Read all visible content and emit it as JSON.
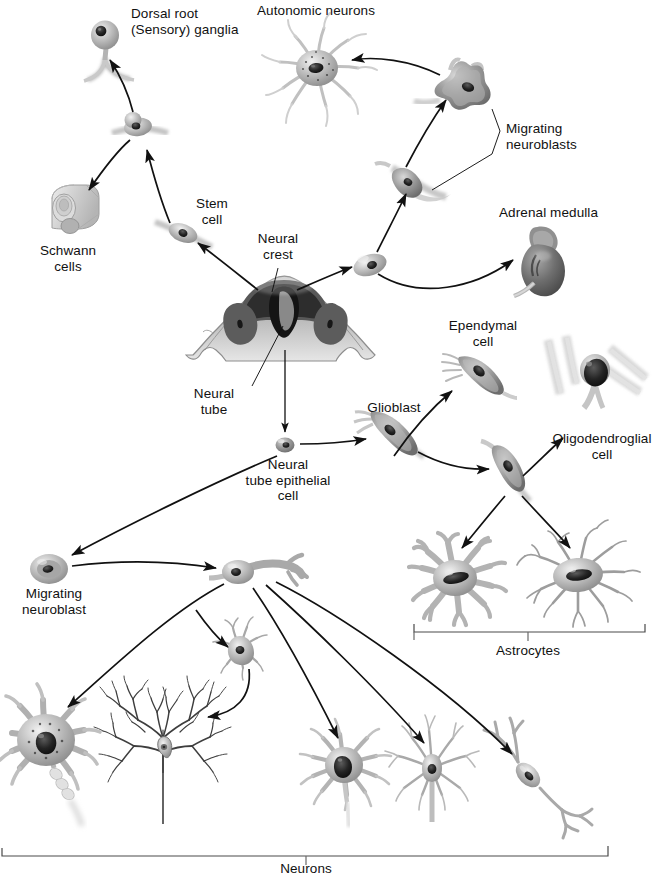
{
  "figure": {
    "background_color": "#ffffff",
    "ink_color": "#111111",
    "cell_fill_light": "#d8d8d8",
    "cell_fill_mid": "#9a9a9a",
    "cell_fill_dark": "#4a4a4a",
    "nucleus_color": "#1d1d1d"
  },
  "labels": {
    "dorsal_root_ganglia": "Dorsal root\n(Sensory) ganglia",
    "autonomic_neurons": "Autonomic neurons",
    "migrating_neuroblasts": "Migrating\nneuroblasts",
    "adrenal_medulla": "Adrenal medulla",
    "schwann_cells": "Schwann\ncells",
    "stem_cell": "Stem\ncell",
    "neural_crest": "Neural\ncrest",
    "neural_tube": "Neural\ntube",
    "neural_tube_epithelial_cell": "Neural\ntube epithelial\ncell",
    "glioblast": "Glioblast",
    "ependymal_cell": "Ependymal\ncell",
    "oligodendroglial_cell": "Oligodendroglial\ncell",
    "astrocytes": "Astrocytes",
    "migrating_neuroblast": "Migrating\nneuroblast",
    "neurons": "Neurons"
  },
  "brackets": [
    {
      "name": "astrocytes-bracket",
      "label": "Astrocytes",
      "x1": 414,
      "x2": 645,
      "y": 630
    },
    {
      "name": "neurons-bracket",
      "label": "Neurons",
      "x1": 2,
      "x2": 608,
      "y": 855
    }
  ],
  "cells": [
    {
      "name": "dorsal-root-ganglion-cell",
      "type": "unipolar-ganglion",
      "x": 105,
      "y": 35
    },
    {
      "name": "stem-cell-precursor",
      "type": "bipolar-spindle",
      "x": 138,
      "y": 128
    },
    {
      "name": "schwann-cell",
      "type": "myelin-cylinder",
      "x": 68,
      "y": 212
    },
    {
      "name": "stem-cell",
      "type": "bipolar-spindle",
      "x": 183,
      "y": 232
    },
    {
      "name": "neural-tube-section",
      "type": "neural-tube-cross-section",
      "x": 283,
      "y": 318
    },
    {
      "name": "crest-derived-cell",
      "type": "oval-cell",
      "x": 370,
      "y": 265
    },
    {
      "name": "migrating-neuroblast-lower",
      "type": "spindle-neuroblast",
      "x": 413,
      "y": 180
    },
    {
      "name": "migrating-neuroblast-upper",
      "type": "stellate-neuroblast",
      "x": 466,
      "y": 92
    },
    {
      "name": "autonomic-neuron",
      "type": "multipolar-neuron",
      "x": 317,
      "y": 68
    },
    {
      "name": "adrenal-medulla",
      "type": "adrenal-gland",
      "x": 538,
      "y": 253
    },
    {
      "name": "neural-tube-epithelial-cell",
      "type": "small-oval-cell",
      "x": 285,
      "y": 445
    },
    {
      "name": "glioblast",
      "type": "glioblast-cell",
      "x": 388,
      "y": 431
    },
    {
      "name": "ependymal-cell",
      "type": "ependymal-cell",
      "x": 477,
      "y": 368
    },
    {
      "name": "glioblast-secondary",
      "type": "glioblast-cell",
      "x": 507,
      "y": 465
    },
    {
      "name": "oligodendroglial-cell",
      "type": "oligodendrocyte",
      "x": 595,
      "y": 385
    },
    {
      "name": "protoplasmic-astrocyte",
      "type": "astrocyte-bushy",
      "x": 455,
      "y": 578
    },
    {
      "name": "fibrous-astrocyte",
      "type": "astrocyte-fibrous",
      "x": 578,
      "y": 575
    },
    {
      "name": "migrating-neuroblast",
      "type": "oval-cell",
      "x": 49,
      "y": 569
    },
    {
      "name": "bipolar-neuroblast",
      "type": "bipolar-neuroblast",
      "x": 248,
      "y": 573
    },
    {
      "name": "small-multipolar-neuron",
      "type": "small-multipolar-neuron",
      "x": 240,
      "y": 648
    },
    {
      "name": "large-motor-neuron",
      "type": "large-multipolar-neuron",
      "x": 46,
      "y": 740
    },
    {
      "name": "purkinje-cell",
      "type": "purkinje-neuron",
      "x": 163,
      "y": 755
    },
    {
      "name": "stellate-neuron",
      "type": "multipolar-neuron",
      "x": 344,
      "y": 765
    },
    {
      "name": "pyramidal-neuron",
      "type": "pyramidal-neuron",
      "x": 432,
      "y": 770
    },
    {
      "name": "bipolar-neuron",
      "type": "bipolar-neuron",
      "x": 528,
      "y": 775
    }
  ],
  "arrows": [
    {
      "name": "arrow-stemcell-to-precursor",
      "from": "stem-cell",
      "to": "stem-cell-precursor"
    },
    {
      "name": "arrow-precursor-to-ganglion",
      "from": "stem-cell-precursor",
      "to": "dorsal-root-ganglion-cell"
    },
    {
      "name": "arrow-precursor-to-schwann",
      "from": "stem-cell-precursor",
      "to": "schwann-cell"
    },
    {
      "name": "arrow-crest-to-stemcell",
      "from": "neural-tube-section",
      "to": "stem-cell"
    },
    {
      "name": "arrow-crest-to-ovalcell",
      "from": "neural-tube-section",
      "to": "crest-derived-cell"
    },
    {
      "name": "arrow-ovalcell-to-neuroblast",
      "from": "crest-derived-cell",
      "to": "migrating-neuroblast-lower"
    },
    {
      "name": "arrow-neuroblast-to-neuroblast",
      "from": "migrating-neuroblast-lower",
      "to": "migrating-neuroblast-upper"
    },
    {
      "name": "arrow-neuroblast-to-autonomic",
      "from": "migrating-neuroblast-upper",
      "to": "autonomic-neuron"
    },
    {
      "name": "arrow-ovalcell-to-adrenal",
      "from": "crest-derived-cell",
      "to": "adrenal-medulla"
    },
    {
      "name": "arrow-tube-to-epithelial",
      "from": "neural-tube-section",
      "to": "neural-tube-epithelial-cell"
    },
    {
      "name": "arrow-epithelial-to-glioblast",
      "from": "neural-tube-epithelial-cell",
      "to": "glioblast"
    },
    {
      "name": "arrow-glioblast-to-ependymal",
      "from": "glioblast",
      "to": "ependymal-cell"
    },
    {
      "name": "arrow-glioblast-to-glioblast2",
      "from": "glioblast",
      "to": "glioblast-secondary"
    },
    {
      "name": "arrow-glioblast2-to-oligodendroglial",
      "from": "glioblast-secondary",
      "to": "oligodendroglial-cell"
    },
    {
      "name": "arrow-glioblast2-to-astrocyte1",
      "from": "glioblast-secondary",
      "to": "protoplasmic-astrocyte"
    },
    {
      "name": "arrow-glioblast2-to-astrocyte2",
      "from": "glioblast-secondary",
      "to": "fibrous-astrocyte"
    },
    {
      "name": "arrow-epithelial-to-migrating-neuroblast",
      "from": "neural-tube-epithelial-cell",
      "to": "migrating-neuroblast"
    },
    {
      "name": "arrow-migrating-to-bipolar",
      "from": "migrating-neuroblast",
      "to": "bipolar-neuroblast"
    },
    {
      "name": "arrow-bipolar-to-large-motor",
      "from": "bipolar-neuroblast",
      "to": "large-motor-neuron"
    },
    {
      "name": "arrow-bipolar-to-small-multipolar",
      "from": "bipolar-neuroblast",
      "to": "small-multipolar-neuron"
    },
    {
      "name": "arrow-small-multipolar-to-purkinje",
      "from": "small-multipolar-neuron",
      "to": "purkinje-cell"
    },
    {
      "name": "arrow-bipolar-to-stellate",
      "from": "bipolar-neuroblast",
      "to": "stellate-neuron"
    },
    {
      "name": "arrow-bipolar-to-pyramidal",
      "from": "bipolar-neuroblast",
      "to": "pyramidal-neuron"
    },
    {
      "name": "arrow-bipolar-to-bipolarneuron",
      "from": "bipolar-neuroblast",
      "to": "bipolar-neuron"
    }
  ],
  "leaders": [
    {
      "name": "leader-neural-crest",
      "label": "Neural crest"
    },
    {
      "name": "leader-neural-tube",
      "label": "Neural tube"
    },
    {
      "name": "leader-migrating-neuroblasts-upper",
      "label": "Migrating neuroblasts"
    },
    {
      "name": "leader-migrating-neuroblasts-lower",
      "label": "Migrating neuroblasts"
    }
  ]
}
